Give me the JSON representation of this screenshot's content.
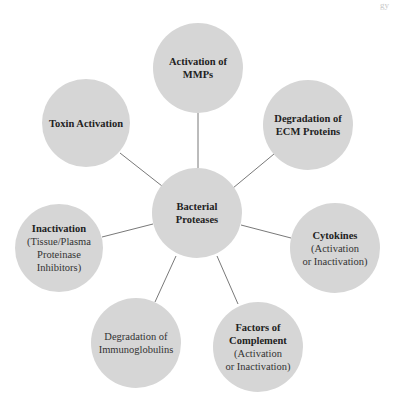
{
  "header": {
    "fragment": "gy"
  },
  "diagram": {
    "type": "hub-and-spoke",
    "colors": {
      "node_fill": "#d6d6d6",
      "connector": "#555555",
      "text": "#222222",
      "background": "#ffffff"
    },
    "center": {
      "title": "Bacterial Proteases",
      "title_line1": "Bacterial",
      "title_line2": "Proteases"
    },
    "nodes": [
      {
        "id": "mmps",
        "title_line1": "Activation of",
        "title_line2": "MMPs"
      },
      {
        "id": "ecm",
        "title_line1": "Degradation of",
        "title_line2": "ECM Proteins"
      },
      {
        "id": "cytokines",
        "title": "Cytokines",
        "sub_line1": "(Activation",
        "sub_line2": "or Inactivation)"
      },
      {
        "id": "complement",
        "title_line1": "Factors of",
        "title_line2": "Complement",
        "sub_line1": "(Activation",
        "sub_line2": "or Inactivation)"
      },
      {
        "id": "immunoglobulins",
        "plain_line1": "Degradation of",
        "plain_line2": "Immunoglobulins"
      },
      {
        "id": "inactivation",
        "title": "Inactivation",
        "sub_line1": "(Tissue/Plasma",
        "sub_line2": "Proteinase",
        "sub_line3": "Inhibitors)"
      },
      {
        "id": "toxin",
        "title": "Toxin Activation"
      }
    ]
  }
}
